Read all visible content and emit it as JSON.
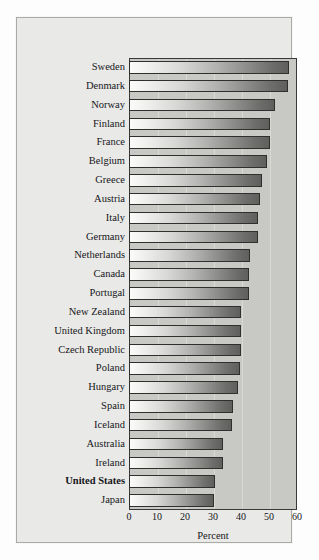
{
  "chart_data": {
    "type": "bar",
    "orientation": "horizontal",
    "title": "",
    "subtitle": "",
    "xlabel": "Percent",
    "ylabel": "",
    "xlim": [
      0,
      60
    ],
    "xticks": [
      0,
      10,
      20,
      30,
      40,
      50,
      60
    ],
    "xtick_labels": [
      "0",
      "10",
      "20",
      "30",
      "40",
      "50",
      "60"
    ],
    "grid": "vertical",
    "legend": "none",
    "categories": [
      "Sweden",
      "Denmark",
      "Norway",
      "Finland",
      "France",
      "Belgium",
      "Greece",
      "Austria",
      "Italy",
      "Germany",
      "Netherlands",
      "Canada",
      "Portugal",
      "New Zealand",
      "United Kingdom",
      "Czech Republic",
      "Poland",
      "Hungary",
      "Spain",
      "Iceland",
      "Australia",
      "Ireland",
      "United States",
      "Japan"
    ],
    "values": [
      57.1,
      56.8,
      52.1,
      50.4,
      50.4,
      49.4,
      47.5,
      46.8,
      46.1,
      46.1,
      43.2,
      42.9,
      42.9,
      40.0,
      40.0,
      40.0,
      39.8,
      38.9,
      37.1,
      36.9,
      33.4,
      33.4,
      30.7,
      30.4
    ],
    "highlighted_categories": [
      "United States"
    ]
  },
  "colors": {
    "page_background": "#fdfdfd",
    "panel_background": "#e9e9e7",
    "panel_border": "#a9a9a6",
    "plot_background": "#c8c8c4",
    "plot_border": "#3a3a38",
    "gridline": "#ddddd8",
    "bar_outline": "#2f2f2d",
    "bar_gradient_start": "#fbfbfa",
    "bar_gradient_end": "#5f5f5d",
    "text": "#16161a"
  }
}
